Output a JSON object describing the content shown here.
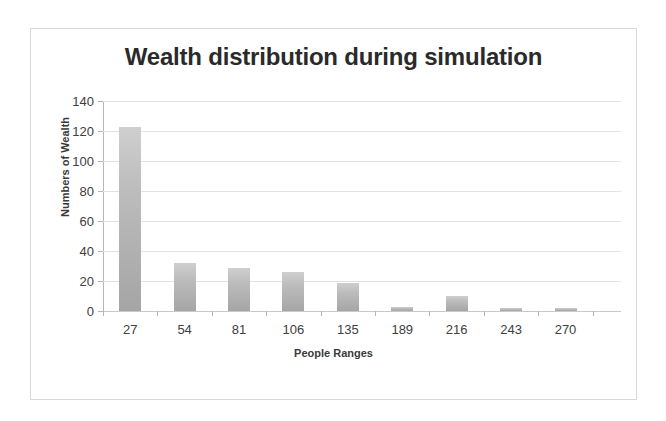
{
  "chart_data": {
    "type": "bar",
    "title": "Wealth distribution during simulation",
    "xlabel": "People Ranges",
    "ylabel": "Numbers of Wealth",
    "categories": [
      "27",
      "54",
      "81",
      "106",
      "135",
      "189",
      "216",
      "243",
      "270"
    ],
    "values": [
      123,
      32,
      29,
      26,
      19,
      3,
      10,
      2,
      2
    ],
    "ylim": [
      0,
      140
    ],
    "ytick_labels": [
      "0",
      "20",
      "40",
      "60",
      "80",
      "100",
      "120",
      "140"
    ],
    "ytick_values": [
      0,
      20,
      40,
      60,
      80,
      100,
      120,
      140
    ],
    "grid": true,
    "legend": false,
    "bar_color": "#b4b4b4",
    "gridline_color": "#e2e2e2",
    "axis_color": "#b5b5b5",
    "title_color": "#2a2a2a",
    "frame_color": "#d8d8d8",
    "background_color": "#ffffff"
  }
}
